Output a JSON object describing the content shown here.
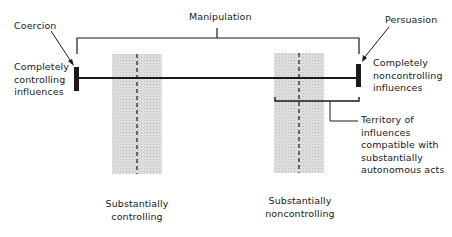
{
  "diagram": {
    "top_bracket_label": "Manipulation",
    "left_end": {
      "pointer_label": "Coercion",
      "description_lines": [
        "Completely",
        "controlling",
        "influences"
      ]
    },
    "right_end": {
      "pointer_label": "Persuasion",
      "description_lines": [
        "Completely",
        "noncontrolling",
        "influences"
      ]
    },
    "zones": [
      {
        "label_lines": [
          "Substantially",
          "controlling"
        ]
      },
      {
        "label_lines": [
          "Substantially",
          "noncontrolling"
        ]
      }
    ],
    "territory_label_lines": [
      "Territory of",
      "influences",
      "compatible with",
      "substantially",
      "autonomous acts"
    ],
    "colors": {
      "ink": "#1a1a1a",
      "zone_fill": "#d6d6d6"
    }
  }
}
